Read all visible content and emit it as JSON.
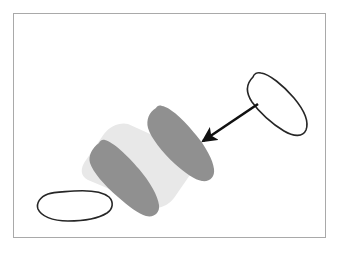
{
  "figure": {
    "title": "Shoe insole assembly diagram",
    "frame": {
      "x": 13,
      "y": 13,
      "width": 313,
      "height": 225,
      "stroke_color": "#a9a9a9",
      "fill_color": "#ffffff",
      "stroke_width": 1
    },
    "colors": {
      "background": "#ffffff",
      "band_fill": "#e8e8e8",
      "insole_dark_fill": "#909090",
      "outline_stroke": "#262626",
      "arrow_color": "#111111",
      "frame_stroke": "#a9a9a9"
    },
    "elements": [
      {
        "id": "stacked-insole-band",
        "name": "light-gray-band",
        "label": "Light gray stacked insole band",
        "fill": "#e8e8e8",
        "stroke": "none",
        "path": "M 128 124 C 120 122 110 126 104 134 L 86 160 C 80 168 80 176 88 180 L 150 206 C 158 210 168 206 174 198 L 192 172 C 198 164 198 156 190 152 Z",
        "rotation_deg": 0
      },
      {
        "id": "insole-dark-left",
        "name": "dark-insole-left",
        "label": "Dark gray insole, left",
        "fill": "#909090",
        "stroke": "none",
        "path": "M 99 143 C 92 148 88 156 90 163 C 93 172 104 185 118 197 C 128 206 139 214 146 216 C 154 218 160 213 159 205 C 158 196 150 182 139 169 C 127 155 113 142 105 140 C 102 139 100 141 99 143 Z"
      },
      {
        "id": "insole-dark-right",
        "name": "dark-insole-right",
        "label": "Dark gray insole, right",
        "fill": "#909090",
        "stroke": "none",
        "path": "M 156 108 C 149 112 146 120 148 128 C 151 138 162 152 175 164 C 185 173 195 180 202 181 C 210 182 215 177 214 169 C 213 160 206 147 196 135 C 184 120 170 107 162 106 C 159 105 157 106 156 108 Z"
      },
      {
        "id": "insole-outline-topright",
        "name": "outlined-insole-upper-right",
        "label": "Outlined insole, upper right (tilted)",
        "fill": "#ffffff",
        "stroke": "#262626",
        "stroke_width": 1.6,
        "path": "M 253 77 C 246 84 246 93 252 102 C 259 112 272 124 284 131 C 294 137 303 137 306 130 C 309 122 304 110 294 98 C 283 85 269 74 261 73 C 257 72 254 74 253 77 Z"
      },
      {
        "id": "insole-outline-bottomleft",
        "name": "outlined-insole-lower-left",
        "label": "Outlined shoe sole, lower left (horizontal)",
        "fill": "#ffffff",
        "stroke": "#262626",
        "stroke_width": 1.6,
        "path": "M 48 194 C 40 197 36 203 38 209 C 41 216 52 221 68 221 C 84 221 99 218 107 213 C 113 209 114 202 109 197 C 103 192 90 190 74 191 C 62 192 53 192 48 194 Z"
      },
      {
        "id": "assembly-arrow",
        "name": "assembly-arrow",
        "label": "Arrow indicating insole inserted into stack",
        "color": "#111111",
        "stroke_width": 2.6,
        "from": {
          "x": 258,
          "y": 104
        },
        "to": {
          "x": 203,
          "y": 141
        },
        "arrowhead_length": 13,
        "arrowhead_width": 9
      }
    ]
  }
}
